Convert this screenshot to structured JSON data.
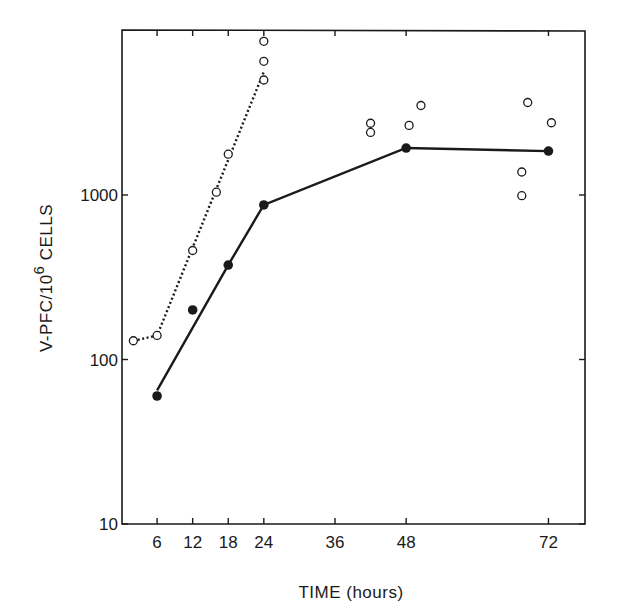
{
  "chart_data": {
    "type": "scatter",
    "title": "",
    "xlabel": "TIME (hours)",
    "ylabel": "V-PFC/10^6 CELLS",
    "ylabel_parts": {
      "main": "V-PFC/10",
      "superscript": "6",
      "tail": " CELLS"
    },
    "yscale": "log",
    "xlim": [
      0,
      78
    ],
    "ylim": [
      10,
      10000
    ],
    "x_ticks": [
      6,
      12,
      18,
      24,
      36,
      48,
      72
    ],
    "x_tick_labels": [
      "6",
      "12",
      "18",
      "24",
      "36",
      "48",
      "72"
    ],
    "y_ticks": [
      10,
      100,
      1000
    ],
    "y_tick_labels": [
      "10",
      "100",
      "1000"
    ],
    "grid": false,
    "legend": null,
    "series": [
      {
        "name": "filled circles (solid line)",
        "marker": "filled-circle",
        "line": "solid",
        "points": [
          {
            "x": 6,
            "y": 60
          },
          {
            "x": 12,
            "y": 200
          },
          {
            "x": 18,
            "y": 375
          },
          {
            "x": 24,
            "y": 870
          },
          {
            "x": 48,
            "y": 1930
          },
          {
            "x": 72,
            "y": 1850
          }
        ],
        "line_points": [
          {
            "x": 6,
            "y": 65
          },
          {
            "x": 18,
            "y": 375
          },
          {
            "x": 24,
            "y": 870
          },
          {
            "x": 48,
            "y": 1930
          },
          {
            "x": 72,
            "y": 1850
          }
        ]
      },
      {
        "name": "open circles (dotted line)",
        "marker": "open-circle",
        "line": "dotted",
        "points": [
          {
            "x": 2,
            "y": 130
          },
          {
            "x": 6,
            "y": 140
          },
          {
            "x": 12,
            "y": 460
          },
          {
            "x": 16,
            "y": 1040
          },
          {
            "x": 18,
            "y": 1770
          },
          {
            "x": 24,
            "y": 5000
          },
          {
            "x": 24,
            "y": 6500
          },
          {
            "x": 24,
            "y": 8600
          }
        ],
        "line_points": [
          {
            "x": 2,
            "y": 130
          },
          {
            "x": 6,
            "y": 140
          },
          {
            "x": 24,
            "y": 5600
          }
        ]
      },
      {
        "name": "open circles (individual, late)",
        "marker": "open-circle",
        "line": "none",
        "points": [
          {
            "x": 42,
            "y": 2730
          },
          {
            "x": 42,
            "y": 2400
          },
          {
            "x": 48.5,
            "y": 2650
          },
          {
            "x": 50.5,
            "y": 3500
          },
          {
            "x": 67.5,
            "y": 1380
          },
          {
            "x": 67.5,
            "y": 990
          },
          {
            "x": 68.5,
            "y": 3650
          },
          {
            "x": 72.5,
            "y": 2750
          }
        ]
      }
    ]
  },
  "colors": {
    "ink": "#1a1a1a",
    "background": "#ffffff"
  }
}
